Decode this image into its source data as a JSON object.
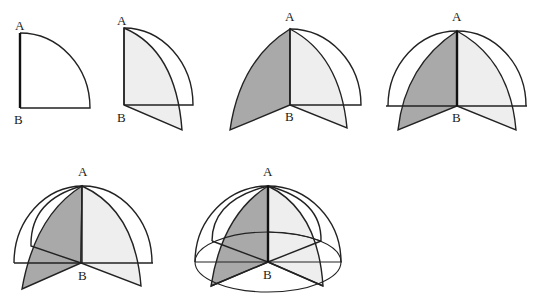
{
  "figure": {
    "panels": [
      {
        "id": 1,
        "label_top": "A",
        "label_bottom": "B",
        "stage": "single quarter disc, axis AB emphasized"
      },
      {
        "id": 2,
        "label_top": "A",
        "label_bottom": "B",
        "stage": "quarter disc rotated slightly, light shaded sector"
      },
      {
        "id": 3,
        "label_top": "A",
        "label_bottom": "B",
        "stage": "two shaded sectors: dark and light"
      },
      {
        "id": 4,
        "label_top": "A",
        "label_bottom": "B",
        "stage": "half circle outline with dark and light sectors"
      },
      {
        "id": 5,
        "label_top": "A",
        "label_bottom": "B",
        "stage": "additional back sector appearing"
      },
      {
        "id": 6,
        "label_top": "A",
        "label_bottom": "B",
        "stage": "complete hemisphere wireframe with equator ellipse"
      }
    ]
  },
  "colors": {
    "stroke": "#222222",
    "dark_fill": "#a9a9a9",
    "light_fill": "#eeeeee",
    "background": "#ffffff"
  }
}
